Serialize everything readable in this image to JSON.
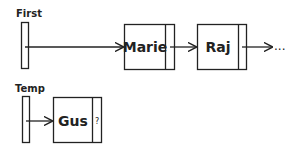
{
  "diagram": {
    "pointers": [
      {
        "label": "First"
      },
      {
        "label": "Temp"
      }
    ],
    "nodes": [
      {
        "value": "Marie",
        "next": ""
      },
      {
        "value": "Raj",
        "next": ""
      },
      {
        "value": "Gus",
        "next": "?"
      }
    ],
    "continuation": "...",
    "colors": {
      "stroke": "#222222",
      "background": "#ffffff"
    }
  }
}
